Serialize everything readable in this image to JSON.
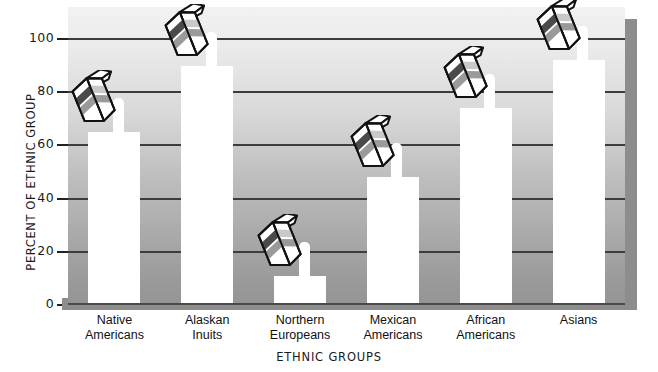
{
  "chart_data": {
    "type": "bar",
    "title": "",
    "xlabel": "ETHNIC GROUPS",
    "ylabel": "PERCENT OF ETHNIC GROUP",
    "categories": [
      "Native\nAmericans",
      "Alaskan\nInuits",
      "Northern\nEuropeans",
      "Mexican\nAmericans",
      "African\nAmericans",
      "Asians"
    ],
    "category_lines": [
      [
        "Native",
        "Americans"
      ],
      [
        "Alaskan",
        "Inuits"
      ],
      [
        "Northern",
        "Europeans"
      ],
      [
        "Mexican",
        "Americans"
      ],
      [
        "African",
        "Americans"
      ],
      [
        "Asians"
      ]
    ],
    "values": [
      65,
      90,
      11,
      48,
      74,
      92
    ],
    "ylim": [
      0,
      112
    ],
    "yticks": [
      0,
      20,
      40,
      60,
      80,
      100
    ],
    "ytick_labels": [
      "0",
      "20",
      "40",
      "60",
      "80",
      "100"
    ],
    "grid": true,
    "grid_axis": "y",
    "legend": "none",
    "bar_color": "#ffffff",
    "grid_color": "#3c3c3c",
    "plot_bg_gradient_top": "#f2f2f2",
    "plot_bg_gradient_bottom": "#949494",
    "annotation_icon": "milk-carton-icon",
    "annotation_count": 6
  }
}
